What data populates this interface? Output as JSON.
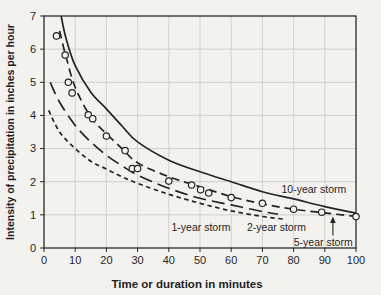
{
  "figure": {
    "background": "#f3f2ef",
    "grid_color": "#c6c6c4",
    "axis_color": "#2a2a2a",
    "curve_color": "#242424"
  },
  "chart_data": {
    "type": "line",
    "title": "",
    "xlabel": "Time or duration in minutes",
    "ylabel": "Intensity of precipitation in inches per hour",
    "xlim": [
      0,
      100
    ],
    "ylim": [
      0,
      7
    ],
    "xticks": [
      0,
      10,
      20,
      30,
      40,
      50,
      60,
      70,
      80,
      90,
      100
    ],
    "yticks": [
      0,
      1,
      2,
      3,
      4,
      5,
      6,
      7
    ],
    "grid": true,
    "legend_position": "inline-labels",
    "series": [
      {
        "name": "10-year storm",
        "line_style": "solid",
        "dash": "",
        "points": [
          [
            5.5,
            7.0
          ],
          [
            7,
            6.35
          ],
          [
            10,
            5.5
          ],
          [
            15,
            4.7
          ],
          [
            20,
            4.2
          ],
          [
            25,
            3.68
          ],
          [
            30,
            3.2
          ],
          [
            40,
            2.65
          ],
          [
            50,
            2.3
          ],
          [
            60,
            2.0
          ],
          [
            70,
            1.7
          ],
          [
            80,
            1.48
          ],
          [
            90,
            1.25
          ],
          [
            100,
            1.05
          ]
        ]
      },
      {
        "name": "5-year storm",
        "line_style": "dashed",
        "dash": "8 5",
        "points": [
          [
            5,
            6.55
          ],
          [
            7,
            5.8
          ],
          [
            10,
            4.85
          ],
          [
            15,
            3.95
          ],
          [
            20,
            3.45
          ],
          [
            25,
            3.0
          ],
          [
            30,
            2.57
          ],
          [
            40,
            2.15
          ],
          [
            50,
            1.85
          ],
          [
            60,
            1.55
          ],
          [
            70,
            1.33
          ],
          [
            80,
            1.17
          ],
          [
            90,
            1.06
          ],
          [
            100,
            0.95
          ]
        ]
      },
      {
        "name": "2-year storm",
        "line_style": "long-dash",
        "dash": "13 6",
        "points": [
          [
            2,
            5.0
          ],
          [
            5,
            4.4
          ],
          [
            10,
            3.7
          ],
          [
            15,
            3.2
          ],
          [
            20,
            2.8
          ],
          [
            25,
            2.48
          ],
          [
            30,
            2.2
          ],
          [
            40,
            1.8
          ],
          [
            50,
            1.5
          ],
          [
            60,
            1.3
          ],
          [
            70,
            1.1
          ],
          [
            75,
            1.02
          ]
        ]
      },
      {
        "name": "1-year storm",
        "line_style": "short-dash",
        "dash": "4.5 3.5",
        "points": [
          [
            1.5,
            4.15
          ],
          [
            5,
            3.5
          ],
          [
            10,
            3.0
          ],
          [
            15,
            2.62
          ],
          [
            20,
            2.38
          ],
          [
            25,
            2.15
          ],
          [
            30,
            1.95
          ],
          [
            40,
            1.62
          ],
          [
            50,
            1.35
          ],
          [
            60,
            1.12
          ],
          [
            70,
            0.95
          ],
          [
            77,
            0.87
          ]
        ]
      }
    ],
    "scatter": {
      "name": "observed data points (5-year storm)",
      "marker": "circle",
      "points": [
        [
          4,
          6.4
        ],
        [
          6.8,
          5.82
        ],
        [
          7.8,
          5.0
        ],
        [
          9,
          4.68
        ],
        [
          14.2,
          4.02
        ],
        [
          15.6,
          3.9
        ],
        [
          20,
          3.38
        ],
        [
          26,
          2.94
        ],
        [
          28.3,
          2.4
        ],
        [
          30,
          2.4
        ],
        [
          40,
          2.02
        ],
        [
          47.3,
          1.9
        ],
        [
          50.2,
          1.76
        ],
        [
          52.8,
          1.66
        ],
        [
          60,
          1.52
        ],
        [
          70,
          1.35
        ],
        [
          80,
          1.17
        ],
        [
          89,
          1.08
        ],
        [
          100,
          0.95
        ]
      ]
    },
    "annotations": [
      {
        "text": "10-year storm",
        "x": 86.5,
        "y": 1.78
      },
      {
        "text": "2-year storm",
        "x": 74.5,
        "y": 0.63
      },
      {
        "text": "1-year storm",
        "x": 50.3,
        "y": 0.63
      },
      {
        "text": "5-year storm",
        "x": 89.5,
        "y": 0.18,
        "arrow": {
          "x": 92.6,
          "from_y": 0.38,
          "to_y": 0.95
        }
      }
    ]
  }
}
